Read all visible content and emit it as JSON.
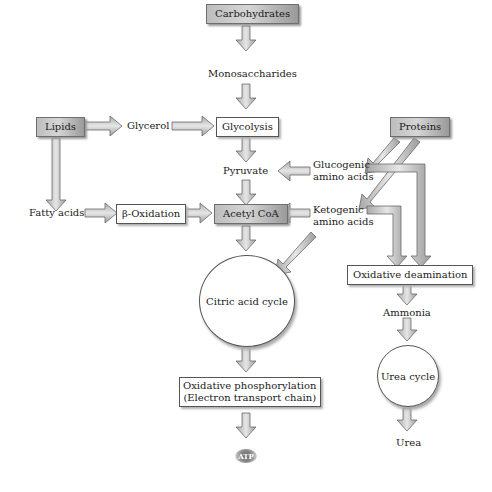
{
  "diagram": {
    "nodes": {
      "carbohydrates": "Carbohydrates",
      "monosaccharides": "Monosaccharides",
      "lipids": "Lipids",
      "glycerol": "Glycerol",
      "glycolysis": "Glycolysis",
      "proteins": "Proteins",
      "pyruvate": "Pyruvate",
      "glucogenic_1": "Glucogenic",
      "glucogenic_2": "amino acids",
      "fatty_acids": "Fatty acids",
      "beta_oxidation": "β-Oxidation",
      "acetyl_coa": "Acetyl CoA",
      "ketogenic_1": "Ketogenic",
      "ketogenic_2": "amino acids",
      "oxidative_deamination": "Oxidative deamination",
      "citric_acid_cycle": "Citric acid cycle",
      "ammonia": "Ammonia",
      "urea_cycle": "Urea cycle",
      "oxphos_1": "Oxidative phosphorylation",
      "oxphos_2": "(Electron transport chain)",
      "atp": "ATP",
      "urea": "Urea"
    },
    "edges": [
      [
        "Carbohydrates",
        "Monosaccharides"
      ],
      [
        "Monosaccharides",
        "Glycolysis"
      ],
      [
        "Lipids",
        "Glycerol"
      ],
      [
        "Glycerol",
        "Glycolysis"
      ],
      [
        "Lipids",
        "Fatty acids"
      ],
      [
        "Fatty acids",
        "β-Oxidation"
      ],
      [
        "β-Oxidation",
        "Acetyl CoA"
      ],
      [
        "Glycolysis",
        "Pyruvate"
      ],
      [
        "Pyruvate",
        "Acetyl CoA"
      ],
      [
        "Proteins",
        "Glucogenic amino acids"
      ],
      [
        "Proteins",
        "Ketogenic amino acids"
      ],
      [
        "Proteins",
        "Oxidative deamination"
      ],
      [
        "Glucogenic amino acids",
        "Pyruvate"
      ],
      [
        "Glucogenic amino acids",
        "Oxidative deamination"
      ],
      [
        "Ketogenic amino acids",
        "Acetyl CoA"
      ],
      [
        "Ketogenic amino acids",
        "Citric acid cycle"
      ],
      [
        "Ketogenic amino acids",
        "Oxidative deamination"
      ],
      [
        "Acetyl CoA",
        "Citric acid cycle"
      ],
      [
        "Citric acid cycle",
        "Oxidative phosphorylation"
      ],
      [
        "Oxidative phosphorylation",
        "ATP"
      ],
      [
        "Oxidative deamination",
        "Ammonia"
      ],
      [
        "Ammonia",
        "Urea cycle"
      ],
      [
        "Urea cycle",
        "Urea"
      ]
    ],
    "colors": {
      "arrow_fill": "#d0d0d0",
      "arrow_stroke": "#6a6a6a",
      "dark_box": "#b8b8b8",
      "light_box": "#ffffff"
    }
  }
}
